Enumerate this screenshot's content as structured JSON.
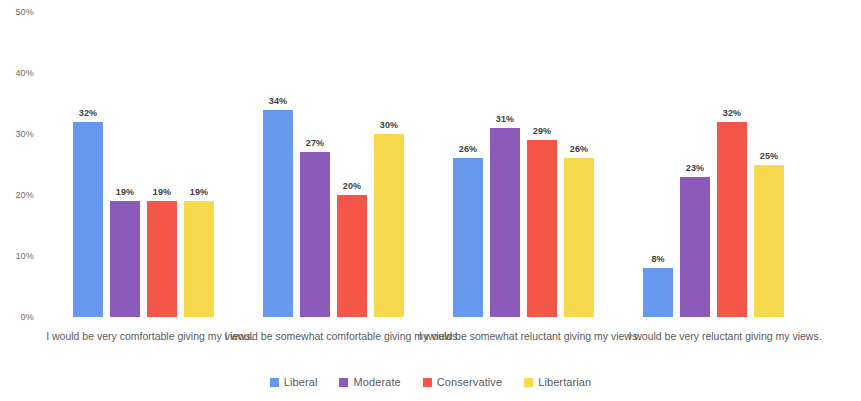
{
  "chart_data": {
    "type": "bar",
    "title": "",
    "subtitle": "",
    "xlabel": "",
    "ylabel": "",
    "ylim": [
      0,
      50
    ],
    "ytick_labels": [
      "50%",
      "40%",
      "30%",
      "20%",
      "10%",
      "0%"
    ],
    "ytick_values": [
      50,
      40,
      30,
      20,
      10,
      0
    ],
    "grid": false,
    "legend_position": "bottom",
    "value_label_suffix": "%",
    "categories": [
      "I would be very comfortable giving my views.",
      "I would be somewhat comfortable giving my views.",
      "I would be somewhat reluctant giving my views.",
      "I would be very reluctant giving my views."
    ],
    "series": [
      {
        "name": "Liberal",
        "color": "#6699ee",
        "values": [
          32,
          34,
          26,
          8
        ],
        "labels": [
          "32%",
          "34%",
          "26%",
          "8%"
        ]
      },
      {
        "name": "Moderate",
        "color": "#8c5ab8",
        "values": [
          19,
          27,
          31,
          23
        ],
        "labels": [
          "19%",
          "27%",
          "31%",
          "23%"
        ]
      },
      {
        "name": "Conservative",
        "color": "#f4564a",
        "values": [
          19,
          20,
          29,
          32
        ],
        "labels": [
          "19%",
          "20%",
          "29%",
          "32%"
        ]
      },
      {
        "name": "Libertarian",
        "color": "#f7d94c",
        "values": [
          19,
          30,
          26,
          25
        ],
        "labels": [
          "19%",
          "30%",
          "26%",
          "25%"
        ]
      }
    ]
  }
}
